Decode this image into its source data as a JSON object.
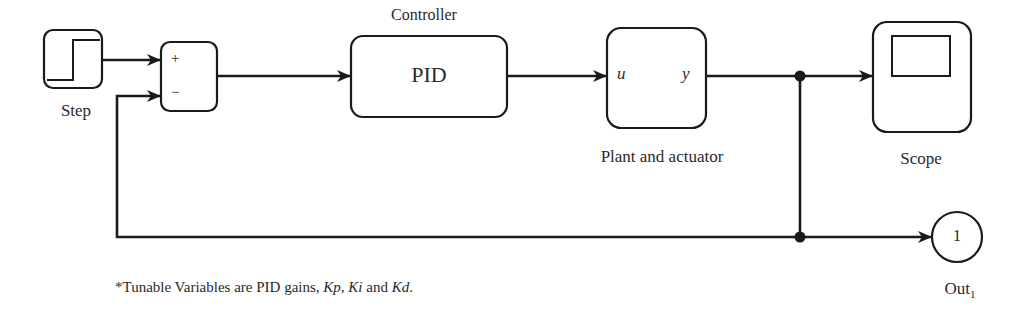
{
  "diagram": {
    "type": "block-diagram",
    "blocks": {
      "step": {
        "label": "Step",
        "icon": "step-signal-icon"
      },
      "sum": {
        "plus": "+",
        "minus": "−"
      },
      "controller": {
        "title": "Controller",
        "label": "PID"
      },
      "plant": {
        "label": "Plant and actuator",
        "input_port": "u",
        "output_port": "y"
      },
      "scope": {
        "label": "Scope",
        "icon": "scope-screen-icon"
      },
      "outport": {
        "number": "1",
        "label": "Out",
        "subscript": "1"
      }
    },
    "connections": [
      {
        "from": "Step",
        "to": "Sum (+)"
      },
      {
        "from": "Sum",
        "to": "PID"
      },
      {
        "from": "PID",
        "to": "Plant and actuator (u)"
      },
      {
        "from": "Plant and actuator (y)",
        "to": "Scope"
      },
      {
        "from": "Plant and actuator (y)",
        "to": "Out1"
      },
      {
        "from": "Plant and actuator (y)",
        "to": "Sum (−)",
        "kind": "feedback"
      }
    ],
    "colors": {
      "stroke": "#1a1a1a",
      "background": "#ffffff"
    }
  },
  "footnote": {
    "prefix": "*Tunable Variables are PID gains, ",
    "kp": "Kp",
    "sep1": ", ",
    "ki": "Ki",
    "and": " and ",
    "kd": "Kd",
    "end": "."
  }
}
